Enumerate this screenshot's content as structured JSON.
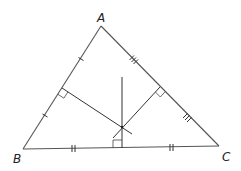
{
  "diagram": {
    "type": "triangle-perpendicular-bisectors",
    "vertices": {
      "A": {
        "label": "A",
        "x": 101,
        "y": 26
      },
      "B": {
        "label": "B",
        "x": 23,
        "y": 149
      },
      "C": {
        "label": "C",
        "x": 219,
        "y": 146
      }
    },
    "labels": {
      "A": "A",
      "B": "B",
      "C": "C"
    },
    "circumcenter": {
      "x": 122,
      "y": 127
    },
    "tick_marks": {
      "AB": 1,
      "AC": 3,
      "BC": 2
    },
    "right_angle_markers": [
      "AB-midpoint",
      "AC-midpoint",
      "BC-midpoint"
    ],
    "colors": {
      "line": "#555555",
      "label": "#222222",
      "background": "#ffffff"
    }
  }
}
